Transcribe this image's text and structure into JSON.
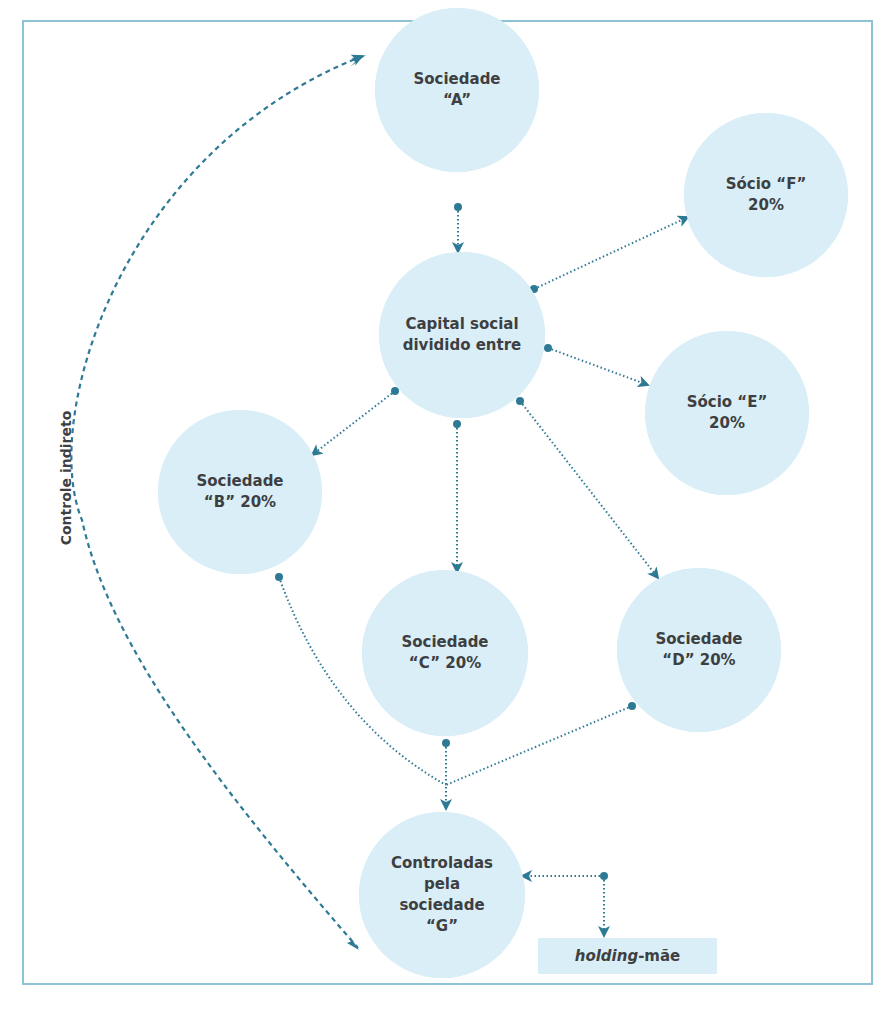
{
  "diagram": {
    "side_label": "Controle indireto",
    "nodes": {
      "a": {
        "line1": "Sociedade",
        "line2": "“A”"
      },
      "capital": {
        "line1": "Capital social",
        "line2": "dividido entre"
      },
      "f": {
        "line1": "Sócio “F”",
        "line2": "20%"
      },
      "e": {
        "line1": "Sócio “E”",
        "line2": "20%"
      },
      "b": {
        "line1": "Sociedade",
        "line2": "“B” 20%"
      },
      "c": {
        "line1": "Sociedade",
        "line2": "“C” 20%"
      },
      "d": {
        "line1": "Sociedade",
        "line2": "“D” 20%"
      },
      "g": {
        "line1": "Controladas",
        "line2": "pela",
        "line3": "sociedade",
        "line4": "“G”"
      }
    },
    "holding": {
      "italic": "holding",
      "rest": "-mãe"
    },
    "colors": {
      "circle_fill": "#d9eef6",
      "arrow": "#2e7a95",
      "border": "#8ec3d6",
      "text": "#3d3f42"
    },
    "edges": [
      {
        "from": "Sociedade A",
        "to": "Capital social"
      },
      {
        "from": "Capital social",
        "to": "Sócio F"
      },
      {
        "from": "Capital social",
        "to": "Sócio E"
      },
      {
        "from": "Capital social",
        "to": "Sociedade B"
      },
      {
        "from": "Capital social",
        "to": "Sociedade C"
      },
      {
        "from": "Capital social",
        "to": "Sociedade D"
      },
      {
        "from": "Sociedade B",
        "to": "Controladas G"
      },
      {
        "from": "Sociedade C",
        "to": "Controladas G"
      },
      {
        "from": "Sociedade D",
        "to": "Controladas G"
      },
      {
        "from": "holding-mãe",
        "to": "Controladas G"
      },
      {
        "from": "Controle indireto",
        "to": "Sociedade A / Controladas G",
        "style": "dashed-curve"
      }
    ]
  }
}
